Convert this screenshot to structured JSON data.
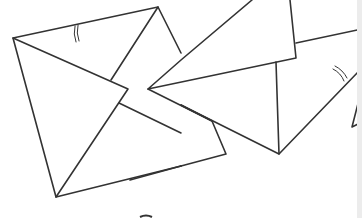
{
  "illustration": {
    "subject": "envelopes line drawing",
    "stroke_color": "#333333",
    "background": "#ffffff",
    "items": [
      "envelope-left",
      "envelope-right-open",
      "envelope-partial-right"
    ]
  }
}
